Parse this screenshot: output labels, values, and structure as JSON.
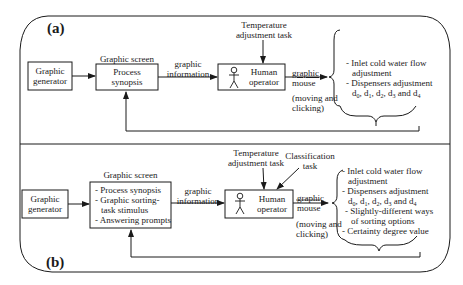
{
  "panel_a": {
    "label": "(a)",
    "generator": [
      "Graphic",
      "generator"
    ],
    "screen_title": "Graphic screen",
    "screen_content": [
      "Process",
      "synopsis"
    ],
    "info_label": [
      "graphic",
      "information"
    ],
    "task_label": [
      "Temperature",
      "adjustment task"
    ],
    "operator": [
      "Human",
      "operator"
    ],
    "output_label": [
      "graphic",
      "mouse"
    ],
    "output_note": [
      "(moving and",
      "clicking)"
    ],
    "actions": [
      "- Inlet cold water flow",
      "  adjustment",
      "- Dispensers adjustment"
    ],
    "dispensers": [
      "d",
      "0",
      ", d",
      "1",
      ", d",
      "2",
      ", d",
      "3",
      " and d",
      "4"
    ]
  },
  "panel_b": {
    "label": "(b)",
    "generator": [
      "Graphic",
      "generator"
    ],
    "screen_title": "Graphic screen",
    "screen_content": [
      "- Process synopsis",
      "- Graphic sorting-",
      "  task stimulus",
      "- Answering prompts"
    ],
    "info_label": [
      "graphic",
      "information"
    ],
    "task_label": [
      "Temperature",
      "adjustment task"
    ],
    "task2_label": [
      "Classification",
      "task"
    ],
    "operator": [
      "Human",
      "operator"
    ],
    "output_label": [
      "graphic",
      "mouse"
    ],
    "output_note": [
      "(moving and",
      "clicking)"
    ],
    "actions": [
      "- Inlet cold water flow",
      "  adjustment",
      "- Dispensers adjustment"
    ],
    "dispensers": [
      "d",
      "0",
      ", d",
      "1",
      ", d",
      "2",
      ", d",
      "3",
      " and d",
      "4"
    ],
    "actions_extra": [
      "- Slightly-different ways",
      "  of sorting options",
      "- Certainty degree value"
    ]
  }
}
